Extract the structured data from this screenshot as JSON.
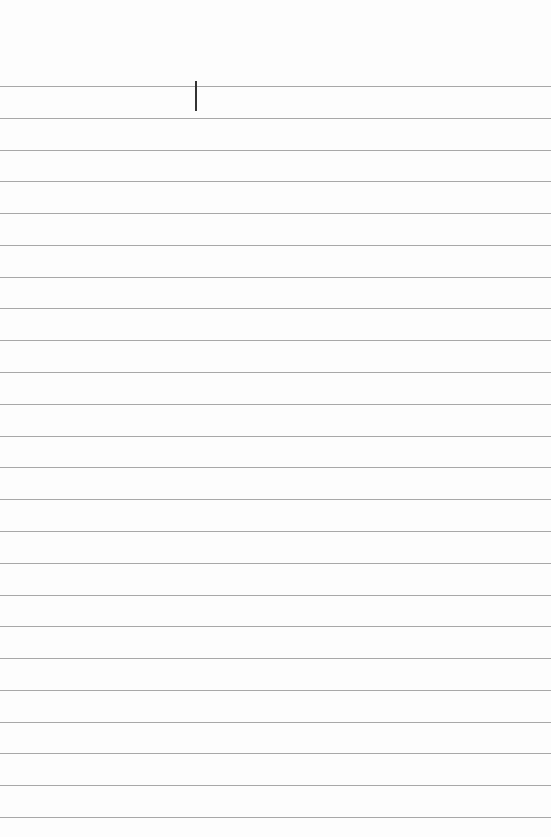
{
  "notepad": {
    "text": "",
    "line_count": 24,
    "colors": {
      "paper": "#fdfdfd",
      "rule": "#a8a8a8",
      "cursor": "#333333"
    }
  }
}
